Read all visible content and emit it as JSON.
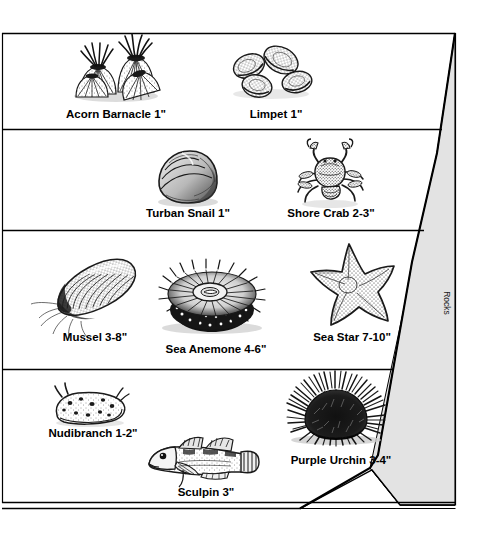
{
  "diagram": {
    "side_label": "Rocks",
    "colors": {
      "ink": "#1a1a1a",
      "rock_fill": "#e3e3e3",
      "frame": "#000000",
      "background": "#ffffff"
    },
    "bands": [
      {
        "band_index": 1,
        "organisms": [
          {
            "name": "Acorn Barnacle",
            "size": "1\"",
            "label": "Acorn Barnacle 1\"",
            "icon": "acorn-barnacle-illustration"
          },
          {
            "name": "Limpet",
            "size": "1\"",
            "label": "Limpet 1\"",
            "icon": "limpet-illustration"
          }
        ]
      },
      {
        "band_index": 2,
        "organisms": [
          {
            "name": "Turban Snail",
            "size": "1\"",
            "label": "Turban Snail 1\"",
            "icon": "turban-snail-illustration"
          },
          {
            "name": "Shore Crab",
            "size": "2-3\"",
            "label": "Shore Crab 2-3\"",
            "icon": "shore-crab-illustration"
          }
        ]
      },
      {
        "band_index": 3,
        "organisms": [
          {
            "name": "Mussel",
            "size": "3-8\"",
            "label": "Mussel 3-8\"",
            "icon": "mussel-illustration"
          },
          {
            "name": "Sea Anemone",
            "size": "4-6\"",
            "label": "Sea Anemone 4-6\"",
            "icon": "sea-anemone-illustration"
          },
          {
            "name": "Sea Star",
            "size": "7-10\"",
            "label": "Sea Star 7-10\"",
            "icon": "sea-star-illustration"
          }
        ]
      },
      {
        "band_index": 4,
        "organisms": [
          {
            "name": "Nudibranch",
            "size": "1-2\"",
            "label": "Nudibranch 1-2\"",
            "icon": "nudibranch-illustration"
          },
          {
            "name": "Sculpin",
            "size": "3\"",
            "label": "Sculpin 3\"",
            "icon": "sculpin-illustration"
          },
          {
            "name": "Purple Urchin",
            "size": "3-4\"",
            "label": "Purple Urchin 3-4\"",
            "icon": "purple-urchin-illustration"
          }
        ]
      }
    ],
    "labels": {
      "acorn_barnacle": "Acorn Barnacle 1\"",
      "limpet": "Limpet 1\"",
      "turban_snail": "Turban Snail 1\"",
      "shore_crab": "Shore Crab 2-3\"",
      "mussel": "Mussel 3-8\"",
      "sea_anemone": "Sea Anemone 4-6\"",
      "sea_star": "Sea Star 7-10\"",
      "nudibranch": "Nudibranch 1-2\"",
      "sculpin": "Sculpin 3\"",
      "purple_urchin": "Purple Urchin 3-4\""
    }
  }
}
